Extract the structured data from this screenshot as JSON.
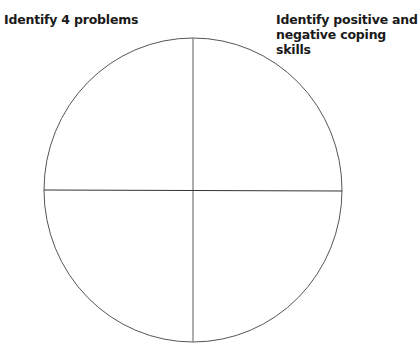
{
  "worksheet": {
    "prompt_left": "Identify 4 problems",
    "prompt_right_line1": "Identify positive and",
    "prompt_right_line2": "negative coping skills"
  },
  "diagram": {
    "shape": "circle divided into four quadrants",
    "stroke_color": "#555555"
  }
}
